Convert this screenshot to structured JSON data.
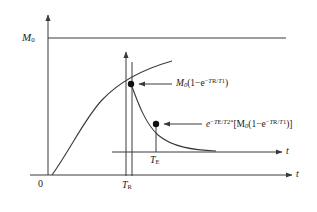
{
  "figure": {
    "type": "diagram",
    "axes": {
      "main_axis_label": "t",
      "secondary_axis_label": "t",
      "origin_label": "0",
      "asymptote_label": "M",
      "asymptote_label_sub": "0"
    },
    "ticks": [
      {
        "name": "tr",
        "label": "T",
        "sub": "R"
      },
      {
        "name": "te",
        "label": "T",
        "sub": "E"
      }
    ],
    "annotations": [
      {
        "name": "recovery-value",
        "parts": {
          "lead": "M",
          "lead_sub": "0",
          "open": "(1−e",
          "exp_minus": "−",
          "exp_num": "T",
          "exp_num_sub": "R",
          "exp_slash": "/",
          "exp_den": "T",
          "exp_den_sub": "1",
          "close": ")"
        }
      },
      {
        "name": "echo-value",
        "parts": {
          "lead": "e",
          "exp_minus": "−",
          "exp_num": "T",
          "exp_num_sub": "E",
          "exp_slash": "/",
          "exp_den": "T",
          "exp_den_sub": "2",
          "exp_star": "*",
          "bracket_open": "[M",
          "bracket_sub": "0",
          "inner_open": "(1−e",
          "inner_exp_minus": "−",
          "inner_exp_num": "T",
          "inner_exp_num_sub": "R",
          "inner_exp_slash": "/",
          "inner_exp_den": "T",
          "inner_exp_den_sub": "1",
          "inner_close": ")",
          "bracket_close": "]"
        }
      }
    ],
    "colors": {
      "line": "#3a3a3a",
      "curve": "#3a3a3a",
      "text": "#1a1a1a",
      "background": "#ffffff"
    }
  }
}
